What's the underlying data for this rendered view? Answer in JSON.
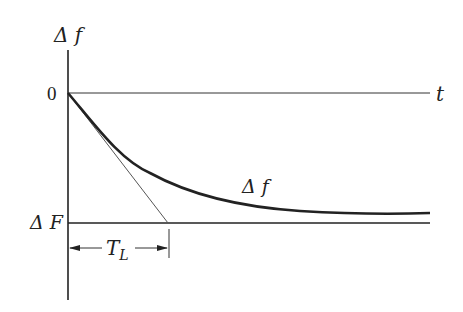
{
  "diagram": {
    "type": "time-response-plot",
    "y_axis_label": "Δ f",
    "x_axis_label": "t",
    "zero_label": "0",
    "steady_state_label": "Δ F",
    "curve_label": "Δ f",
    "time_constant_label": "T",
    "time_constant_subscript": "L",
    "colors": {
      "ink": "#222222",
      "tangent": "#555555",
      "background": "#ffffff"
    }
  }
}
